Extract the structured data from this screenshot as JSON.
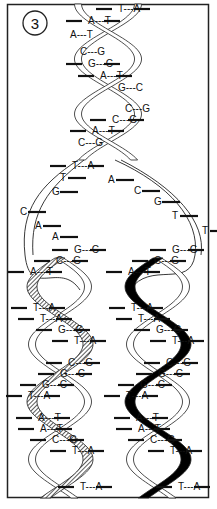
{
  "figure": {
    "panel_number": "3",
    "colors": {
      "ink": "#111111",
      "paper": "#ffffff",
      "left_new_strand": "#7a7a7a",
      "right_new_strand": "#000000"
    }
  },
  "parent_helix": {
    "pairs": [
      {
        "left": "T",
        "right": "A"
      },
      {
        "left": "A",
        "right": "T"
      },
      {
        "left": "A",
        "right": "T"
      },
      {
        "left": "C",
        "right": "G"
      },
      {
        "left": "G",
        "right": "C"
      },
      {
        "left": "A",
        "right": "T"
      },
      {
        "left": "G",
        "right": "C"
      },
      {
        "left": "C",
        "right": "G"
      },
      {
        "left": "C",
        "right": "G"
      },
      {
        "left": "A",
        "right": "T"
      },
      {
        "left": "C",
        "right": "G"
      },
      {
        "left": "T",
        "right": "A"
      }
    ]
  },
  "unpaired_bases": {
    "left_strand": [
      "T",
      "G",
      "C",
      "A",
      "A"
    ],
    "right_strand": [
      "A",
      "C",
      "G",
      "T",
      "T"
    ]
  },
  "daughter_left": {
    "new_strand_style": "hatched",
    "pairs": [
      {
        "left": "G",
        "right": "C"
      },
      {
        "left": "C",
        "right": "G"
      },
      {
        "left": "A",
        "right": "T"
      },
      {
        "left": "T",
        "right": "A"
      },
      {
        "left": "T",
        "right": "A"
      },
      {
        "left": "G",
        "right": "C"
      },
      {
        "left": "T",
        "right": "A"
      },
      {
        "left": "C",
        "right": "G"
      },
      {
        "left": "G",
        "right": "C"
      },
      {
        "left": "G",
        "right": "C"
      },
      {
        "left": "T",
        "right": "A"
      },
      {
        "left": "A",
        "right": "T"
      },
      {
        "left": "A",
        "right": "T"
      },
      {
        "left": "C",
        "right": "G"
      },
      {
        "left": "T",
        "right": "A"
      },
      {
        "left": "T",
        "right": "A"
      }
    ]
  },
  "daughter_right": {
    "new_strand_style": "solid-black",
    "pairs": [
      {
        "left": "G",
        "right": "G"
      },
      {
        "left": "C",
        "right": "G"
      },
      {
        "left": "A",
        "right": "T"
      },
      {
        "left": "T",
        "right": "A"
      },
      {
        "left": "T",
        "right": "A"
      },
      {
        "left": "G",
        "right": "C"
      },
      {
        "left": "T",
        "right": "A"
      },
      {
        "left": "C",
        "right": "G"
      },
      {
        "left": "G",
        "right": "C"
      },
      {
        "left": "G",
        "right": "C"
      },
      {
        "left": "T",
        "right": "A"
      },
      {
        "left": "A",
        "right": "T"
      },
      {
        "left": "A",
        "right": "T"
      },
      {
        "left": "C",
        "right": "G"
      },
      {
        "left": "T",
        "right": "A"
      },
      {
        "left": "T",
        "right": "A"
      }
    ]
  }
}
